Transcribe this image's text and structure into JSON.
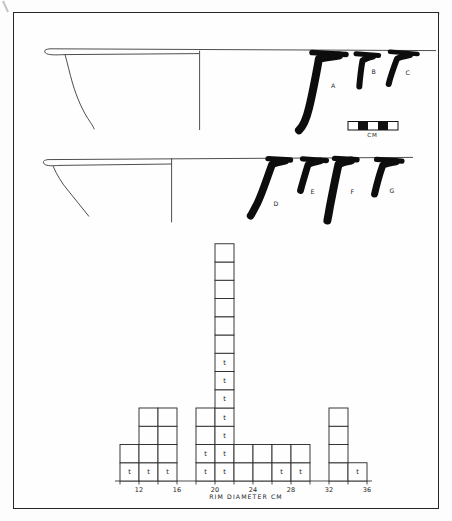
{
  "figure": {
    "type": "archaeological-pottery-figure",
    "sherd_labels_row1": [
      "A",
      "B",
      "C"
    ],
    "sherd_labels_row2": [
      "D",
      "E",
      "F",
      "G"
    ],
    "scale_bar_label": "CM",
    "ink_color": "#1a1a1a",
    "paper_color": "#fdfdfd"
  },
  "chart_data": {
    "type": "bar",
    "variant": "unit-square-histogram",
    "title": "",
    "xlabel": "RIM DIAMETER CM",
    "ylabel": "",
    "cell_marker": "t",
    "bin_width_cm": 2,
    "x_axis_range_cm": [
      10,
      36
    ],
    "x_ticks": [
      12,
      16,
      20,
      24,
      28,
      32,
      36
    ],
    "minor_tick_step_cm": 2,
    "y_max_units": 13,
    "grid": false,
    "bins": [
      {
        "range": [
          10,
          12
        ],
        "count": 2,
        "t_count": 1
      },
      {
        "range": [
          12,
          14
        ],
        "count": 4,
        "t_count": 1
      },
      {
        "range": [
          14,
          16
        ],
        "count": 4,
        "t_count": 1
      },
      {
        "range": [
          16,
          18
        ],
        "count": 0,
        "t_count": 0
      },
      {
        "range": [
          18,
          20
        ],
        "count": 4,
        "t_count": 2
      },
      {
        "range": [
          20,
          22
        ],
        "count": 13,
        "t_count": 7
      },
      {
        "range": [
          22,
          24
        ],
        "count": 2,
        "t_count": 0
      },
      {
        "range": [
          24,
          26
        ],
        "count": 2,
        "t_count": 0
      },
      {
        "range": [
          26,
          28
        ],
        "count": 2,
        "t_count": 1
      },
      {
        "range": [
          28,
          30
        ],
        "count": 2,
        "t_count": 1
      },
      {
        "range": [
          30,
          32
        ],
        "count": 0,
        "t_count": 0
      },
      {
        "range": [
          32,
          34
        ],
        "count": 4,
        "t_count": 0
      },
      {
        "range": [
          34,
          36
        ],
        "count": 1,
        "t_count": 1
      }
    ]
  }
}
